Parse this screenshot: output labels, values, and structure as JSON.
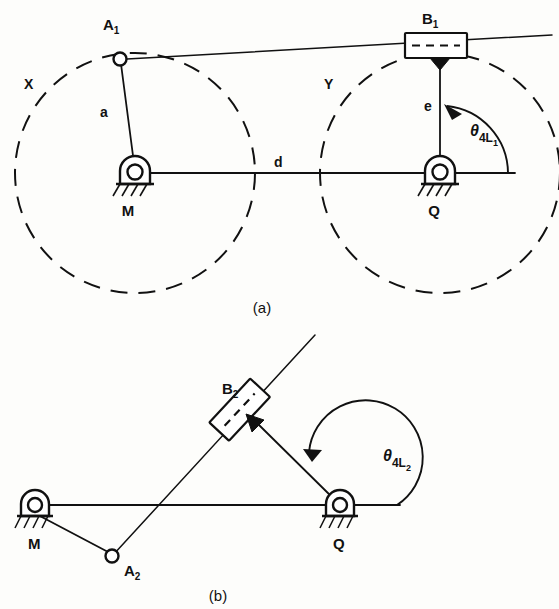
{
  "figure": {
    "panels": [
      {
        "id": "a",
        "caption": "(a)",
        "labels": {
          "joint_a1": "A",
          "joint_a1_sub": "1",
          "block_b1": "B",
          "block_b1_sub": "1",
          "pivot_m": "M",
          "pivot_q": "Q",
          "link_a": "a",
          "link_e": "e",
          "dim_d": "d",
          "circle_x": "X",
          "circle_y": "Y",
          "angle_theta": "θ",
          "angle_sub_main": "4L",
          "angle_sub_minor": "1"
        }
      },
      {
        "id": "b",
        "caption": "(b)",
        "labels": {
          "joint_a2": "A",
          "joint_a2_sub": "2",
          "block_b2": "B",
          "block_b2_sub": "2",
          "pivot_m": "M",
          "pivot_q": "Q",
          "angle_theta": "θ",
          "angle_sub_main": "4L",
          "angle_sub_minor": "2"
        }
      }
    ],
    "colors": {
      "ink": "#111111",
      "paper": "#fdfdfb"
    }
  }
}
